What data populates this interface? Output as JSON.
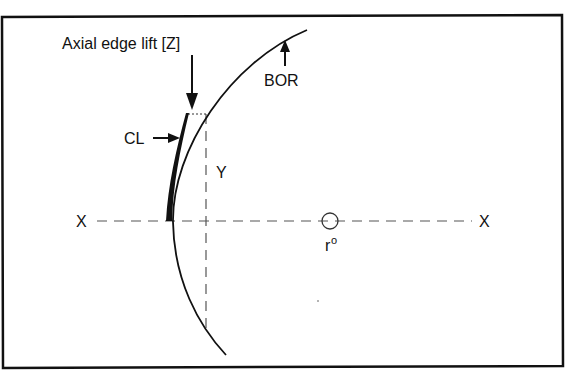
{
  "diagram": {
    "labels": {
      "edge_lift": "Axial edge lift [Z]",
      "bor": "BOR",
      "cl": "CL",
      "y": "Y",
      "x_left": "X",
      "x_right": "X",
      "radius": "r",
      "radius_sup": "o"
    },
    "colors": {
      "line": "#111111",
      "dashed": "#555555",
      "background": "#ffffff"
    }
  }
}
